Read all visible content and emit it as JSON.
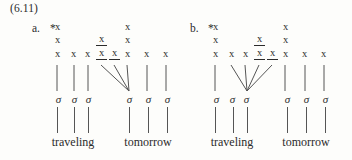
{
  "figure": {
    "example_number": "(6.11)",
    "symbols": {
      "mora": "x",
      "syllable": "σ",
      "ungrammatical": "*"
    },
    "panels": [
      {
        "id": "a",
        "label": "a.",
        "star": "*",
        "columns_x": [
          44,
          60,
          74,
          88,
          101,
          114,
          133,
          152
        ],
        "tiers": [
          {
            "tier": 3,
            "cells": [
              {
                "col": 0,
                "text": "x",
                "underlined": false
              },
              {
                "col": 5,
                "text": "x",
                "underlined": false
              }
            ]
          },
          {
            "tier": 2,
            "cells": [
              {
                "col": 0,
                "text": "x",
                "underlined": false
              },
              {
                "col": 3,
                "text": "x",
                "underlined": true
              },
              {
                "col": 5,
                "text": "x",
                "underlined": false
              }
            ]
          },
          {
            "tier": 1,
            "cells": [
              {
                "col": 0,
                "text": "x",
                "underlined": false
              },
              {
                "col": 1,
                "text": "x",
                "underlined": false
              },
              {
                "col": 2,
                "text": "x",
                "underlined": false
              },
              {
                "col": 3,
                "text": "x",
                "underlined": true
              },
              {
                "col": 4,
                "text": "x",
                "underlined": true
              },
              {
                "col": 5,
                "text": "x",
                "underlined": false
              },
              {
                "col": 6,
                "text": "x",
                "underlined": false
              },
              {
                "col": 7,
                "text": "x",
                "underlined": false
              }
            ]
          }
        ],
        "sigmas": [
          {
            "text": "σ",
            "x": 44
          },
          {
            "text": "σ",
            "x": 62
          },
          {
            "text": "σ",
            "x": 76
          },
          {
            "text": "σ",
            "x": 116
          },
          {
            "text": "σ",
            "x": 136
          },
          {
            "text": "σ",
            "x": 155
          }
        ],
        "association_lines": [
          {
            "x1": 49,
            "y1": 0,
            "x2": 49,
            "y2": 28,
            "type": "vertical"
          },
          {
            "x1": 66,
            "y1": 0,
            "x2": 66,
            "y2": 28,
            "type": "vertical"
          },
          {
            "x1": 80,
            "y1": 0,
            "x2": 80,
            "y2": 28,
            "type": "vertical"
          },
          {
            "x1": 93,
            "y1": 0,
            "x2": 121,
            "y2": 28,
            "type": "diagonal-right"
          },
          {
            "x1": 106,
            "y1": 0,
            "x2": 121,
            "y2": 28,
            "type": "diagonal-right"
          },
          {
            "x1": 119,
            "y1": 0,
            "x2": 121,
            "y2": 28,
            "type": "diagonal-right"
          },
          {
            "x1": 139,
            "y1": 0,
            "x2": 139,
            "y2": 28,
            "type": "vertical"
          },
          {
            "x1": 158,
            "y1": 0,
            "x2": 158,
            "y2": 28,
            "type": "vertical"
          }
        ],
        "stems": [
          49,
          66,
          80,
          121,
          140,
          159
        ],
        "words": [
          {
            "text": "traveling",
            "center": 65
          },
          {
            "text": "tomorrow",
            "center": 140
          }
        ]
      },
      {
        "id": "b",
        "label": "b.",
        "star": "*",
        "columns_x": [
          28,
          44,
          58,
          72,
          85,
          98,
          117,
          136
        ],
        "tiers": [
          {
            "tier": 3,
            "cells": [
              {
                "col": 0,
                "text": "x",
                "underlined": false
              },
              {
                "col": 5,
                "text": "x",
                "underlined": false
              }
            ]
          },
          {
            "tier": 2,
            "cells": [
              {
                "col": 0,
                "text": "x",
                "underlined": false
              },
              {
                "col": 3,
                "text": "x",
                "underlined": true
              },
              {
                "col": 5,
                "text": "x",
                "underlined": false
              }
            ]
          },
          {
            "tier": 1,
            "cells": [
              {
                "col": 0,
                "text": "x",
                "underlined": false
              },
              {
                "col": 1,
                "text": "x",
                "underlined": false
              },
              {
                "col": 2,
                "text": "x",
                "underlined": false
              },
              {
                "col": 3,
                "text": "x",
                "underlined": true
              },
              {
                "col": 4,
                "text": "x",
                "underlined": true
              },
              {
                "col": 5,
                "text": "x",
                "underlined": false
              },
              {
                "col": 6,
                "text": "x",
                "underlined": false
              },
              {
                "col": 7,
                "text": "x",
                "underlined": false
              }
            ]
          }
        ],
        "sigmas": [
          {
            "text": "σ",
            "x": 28
          },
          {
            "text": "σ",
            "x": 46
          },
          {
            "text": "σ",
            "x": 60
          },
          {
            "text": "σ",
            "x": 100
          },
          {
            "text": "σ",
            "x": 120
          },
          {
            "text": "σ",
            "x": 139
          }
        ],
        "association_lines": [
          {
            "x1": 33,
            "y1": 0,
            "x2": 33,
            "y2": 28,
            "type": "vertical"
          },
          {
            "x1": 49,
            "y1": 0,
            "x2": 65,
            "y2": 28,
            "type": "diagonal-left"
          },
          {
            "x1": 63,
            "y1": 0,
            "x2": 65,
            "y2": 28,
            "type": "diagonal-left"
          },
          {
            "x1": 77,
            "y1": 0,
            "x2": 65,
            "y2": 28,
            "type": "diagonal-left"
          },
          {
            "x1": 90,
            "y1": 0,
            "x2": 65,
            "y2": 28,
            "type": "diagonal-left"
          },
          {
            "x1": 103,
            "y1": 0,
            "x2": 103,
            "y2": 28,
            "type": "vertical"
          },
          {
            "x1": 123,
            "y1": 0,
            "x2": 123,
            "y2": 28,
            "type": "vertical"
          },
          {
            "x1": 142,
            "y1": 0,
            "x2": 142,
            "y2": 28,
            "type": "vertical"
          }
        ],
        "stems": [
          33,
          51,
          65,
          105,
          124,
          143
        ],
        "words": [
          {
            "text": "traveling",
            "center": 50
          },
          {
            "text": "tomorrow",
            "center": 124
          }
        ]
      }
    ]
  }
}
